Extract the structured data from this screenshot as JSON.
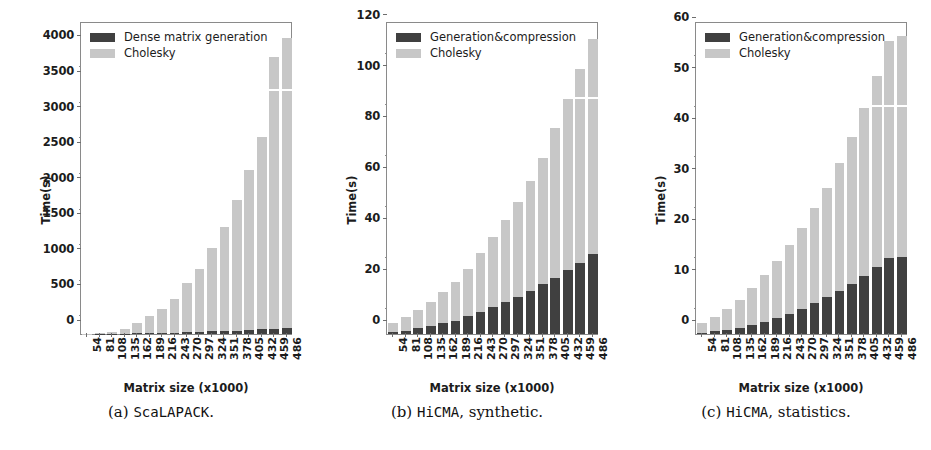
{
  "figure": {
    "panels": [
      {
        "id": "a",
        "caption_prefix": "(a)",
        "caption_mono": "ScaLAPACK",
        "caption_suffix": ".",
        "legend": [
          {
            "label": "Dense matrix generation",
            "color": "#404040"
          },
          {
            "label": "Cholesky",
            "color": "#c7c7c7"
          }
        ],
        "chart_data": {
          "type": "bar",
          "stacked": true,
          "title": "",
          "xlabel": "Matrix size (x1000)",
          "ylabel": "Time(s)",
          "ylim": [
            0,
            4400
          ],
          "yticks": [
            0,
            500,
            1000,
            1500,
            2000,
            2500,
            3000,
            3500,
            4000
          ],
          "grid": false,
          "legend_position": "upper left",
          "categories": [
            "54",
            "81",
            "108",
            "135",
            "162",
            "189",
            "216",
            "243",
            "270",
            "297",
            "324",
            "351",
            "378",
            "405",
            "432",
            "459",
            "486"
          ],
          "series": [
            {
              "name": "Dense matrix generation",
              "color": "#404040",
              "values": [
                1,
                2,
                4,
                6,
                9,
                12,
                16,
                20,
                25,
                30,
                36,
                42,
                49,
                56,
                64,
                72,
                81
              ]
            },
            {
              "name": "Cholesky",
              "color": "#c7c7c7",
              "values": [
                4,
                10,
                26,
                69,
                146,
                238,
                334,
                470,
                695,
                890,
                1179,
                1468,
                1841,
                2254,
                2706,
                3818,
                4079
              ]
            }
          ],
          "totals": [
            5,
            12,
            30,
            75,
            155,
            250,
            350,
            490,
            720,
            920,
            1215,
            1510,
            1890,
            2310,
            2770,
            3890,
            4160
          ]
        }
      },
      {
        "id": "b",
        "caption_prefix": "(b)",
        "caption_mono": "HiCMA",
        "caption_suffix": ", synthetic.",
        "legend": [
          {
            "label": "Generation&compression",
            "color": "#404040"
          },
          {
            "label": "Cholesky",
            "color": "#c7c7c7"
          }
        ],
        "chart_data": {
          "type": "bar",
          "stacked": true,
          "title": "",
          "xlabel": "Matrix size (x1000)",
          "ylabel": "Time(s)",
          "ylim": [
            0,
            123
          ],
          "yticks": [
            0,
            20,
            40,
            60,
            80,
            100,
            120
          ],
          "grid": false,
          "legend_position": "upper left",
          "categories": [
            "54",
            "81",
            "108",
            "135",
            "162",
            "189",
            "216",
            "243",
            "270",
            "297",
            "324",
            "351",
            "378",
            "405",
            "432",
            "459",
            "486"
          ],
          "series": [
            {
              "name": "Generation&compression",
              "color": "#404040",
              "values": [
                0.8,
                1.3,
                2.2,
                3.0,
                4.2,
                5.3,
                7.0,
                8.5,
                10.5,
                12.5,
                14.5,
                17.0,
                19.5,
                22.0,
                25.0,
                28.0,
                31.5
              ]
            },
            {
              "name": "Cholesky",
              "color": "#c7c7c7",
              "values": [
                3.7,
                5.2,
                7.3,
                9.5,
                12.3,
                15.2,
                18.5,
                23.5,
                27.5,
                32.5,
                37.5,
                43.0,
                49.5,
                59.0,
                67.5,
                76.0,
                84.5
              ]
            }
          ],
          "totals": [
            4.5,
            6.5,
            9.5,
            12.5,
            16.5,
            20.5,
            25.5,
            32.0,
            38.0,
            45.0,
            52.0,
            60.0,
            69.0,
            81.0,
            92.5,
            104.0,
            116.0
          ]
        }
      },
      {
        "id": "c",
        "caption_prefix": "(c)",
        "caption_mono": "HiCMA",
        "caption_suffix": ", statistics.",
        "legend": [
          {
            "label": "Generation&compression",
            "color": "#404040"
          },
          {
            "label": "Cholesky",
            "color": "#c7c7c7"
          }
        ],
        "chart_data": {
          "type": "bar",
          "stacked": true,
          "title": "",
          "xlabel": "Matrix size (x1000)",
          "ylabel": "Time(s)",
          "ylim": [
            0,
            62
          ],
          "yticks": [
            0,
            10,
            20,
            30,
            40,
            50,
            60
          ],
          "grid": false,
          "legend_position": "upper left",
          "categories": [
            "54",
            "81",
            "108",
            "135",
            "162",
            "189",
            "216",
            "243",
            "270",
            "297",
            "324",
            "351",
            "378",
            "405",
            "432",
            "459",
            "486"
          ],
          "series": [
            {
              "name": "Generation&compression",
              "color": "#404040",
              "values": [
                0.3,
                0.5,
                0.8,
                1.2,
                1.8,
                2.4,
                3.1,
                4.0,
                5.0,
                6.1,
                7.3,
                8.6,
                10.0,
                11.5,
                13.2,
                15.0,
                15.3
              ]
            },
            {
              "name": "Cholesky",
              "color": "#c7c7c7",
              "values": [
                1.9,
                2.9,
                4.1,
                5.6,
                7.4,
                9.2,
                11.3,
                13.6,
                16.0,
                18.8,
                21.7,
                25.3,
                29.0,
                33.3,
                37.9,
                43.0,
                43.7
              ]
            }
          ],
          "totals": [
            2.2,
            3.4,
            4.9,
            6.8,
            9.2,
            11.6,
            14.4,
            17.6,
            21.0,
            24.9,
            29.0,
            33.9,
            39.0,
            44.8,
            51.1,
            58.0,
            59.0
          ]
        }
      }
    ]
  }
}
